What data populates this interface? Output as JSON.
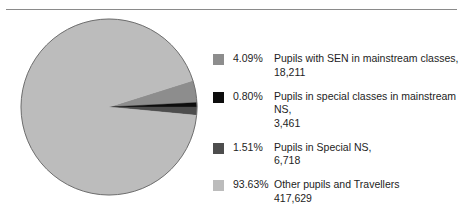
{
  "figure": {
    "background_color": "#ffffff",
    "rule_color": "#8a8a8a"
  },
  "chart_data": {
    "type": "pie",
    "title": "",
    "subtitle": "",
    "xlabel": "",
    "ylabel": "",
    "legend_position": "right",
    "grid": false,
    "start_angle_deg": -17.6,
    "direction": "clockwise",
    "categories": [
      "Pupils with SEN in mainstream classes",
      "Pupils in special classes in mainstream NS",
      "Pupils in Special NS",
      "Other pupils and Travellers"
    ],
    "values": [
      18211,
      3461,
      6718,
      417629
    ],
    "percentages": [
      4.09,
      0.8,
      1.51,
      93.63
    ],
    "percent_labels": [
      "4.09%",
      "0.80%",
      "1.51%",
      "93.63%"
    ],
    "value_labels": [
      "18,211",
      "3,461",
      "6,718",
      "417,629"
    ],
    "colors": [
      "#8d8d8d",
      "#0d0d0d",
      "#4d4d4d",
      "#bcbcbc"
    ],
    "total": 445
  },
  "pie": {
    "center_x": 95,
    "center_y": 95,
    "radius": 88,
    "outline_color": "#6f6f6f",
    "slices": [
      {
        "label": "sen-mainstream",
        "percent": 4.09,
        "color": "#8d8d8d"
      },
      {
        "label": "special-classes-mainstream",
        "percent": 0.8,
        "color": "#0d0d0d"
      },
      {
        "label": "special-ns",
        "percent": 1.51,
        "color": "#4d4d4d"
      },
      {
        "label": "other-pupils-travellers",
        "percent": 93.63,
        "color": "#bcbcbc"
      }
    ]
  },
  "legend": {
    "items": [
      {
        "swatch_color": "#8d8d8d",
        "percent": "4.09%",
        "line1": "Pupils with SEN in mainstream classes,",
        "line2": "18,211"
      },
      {
        "swatch_color": "#0d0d0d",
        "percent": "0.80%",
        "line1": "Pupils in special classes in mainstream NS,",
        "line2": "3,461"
      },
      {
        "swatch_color": "#4d4d4d",
        "percent": "1.51%",
        "line1": "Pupils in Special NS,",
        "line2": "6,718"
      },
      {
        "swatch_color": "#bcbcbc",
        "percent": "93.63%",
        "line1": "Other pupils and Travellers",
        "line2": "417,629"
      }
    ]
  }
}
